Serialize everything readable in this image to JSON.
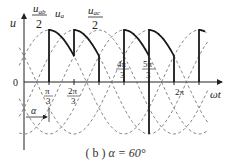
{
  "figure": {
    "caption_prefix": "( b )",
    "caption_alpha": "α = 60°",
    "y_axis_label": "u",
    "x_axis_label": "ωt",
    "origin_label": "0",
    "alpha_marker_label": "α",
    "curve_labels": {
      "uab_num": "u",
      "uab_sub": "ab",
      "uab_den": "2",
      "ua_main": "u",
      "ua_sub": "a",
      "uac_num": "u",
      "uac_sub": "ac",
      "uac_den": "2"
    },
    "ticks": [
      {
        "num": "π",
        "den": "3",
        "pos": "below"
      },
      {
        "num": "2π",
        "den": "3",
        "pos": "below"
      },
      {
        "num": "4π",
        "den": "3",
        "pos": "above"
      },
      {
        "num": "5π",
        "den": "3",
        "pos": "above"
      },
      {
        "label": "2π",
        "pos": "below"
      }
    ],
    "colors": {
      "solid": "#222222",
      "dashed": "#555555"
    }
  }
}
